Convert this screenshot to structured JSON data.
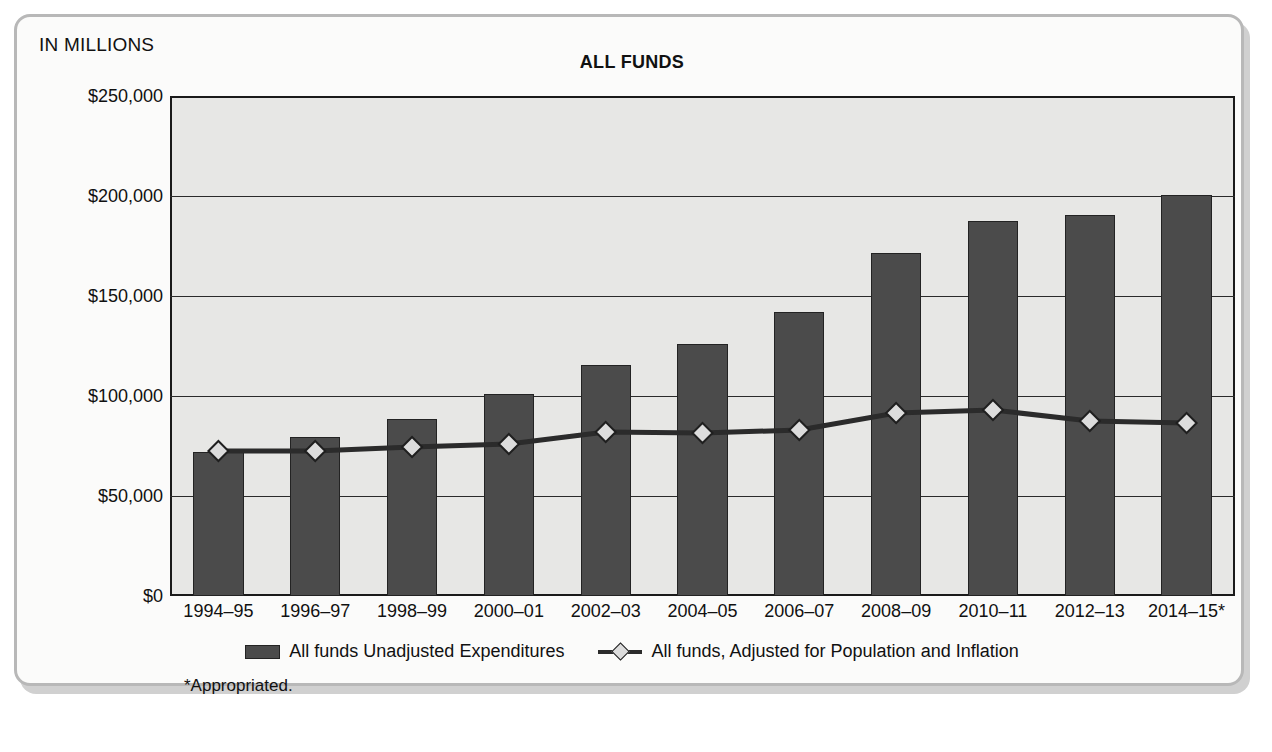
{
  "chart": {
    "units_label": "IN MILLIONS",
    "title": "ALL FUNDS",
    "footnote": "*Appropriated."
  },
  "legend": {
    "items": [
      {
        "marker": "bar-swatch",
        "label": "All funds Unadjusted Expenditures"
      },
      {
        "marker": "line-diamond-swatch",
        "label": "All funds, Adjusted for Population and Inflation"
      }
    ]
  },
  "chart_data": {
    "type": "bar",
    "title": "ALL FUNDS",
    "subtitle": "IN MILLIONS",
    "xlabel": "",
    "ylabel": "IN MILLIONS",
    "ylim": [
      0,
      250000
    ],
    "yticks": [
      0,
      50000,
      100000,
      150000,
      200000,
      250000
    ],
    "ytick_labels": [
      "$0",
      "$50,000",
      "$100,000",
      "$150,000",
      "$200,000",
      "$250,000"
    ],
    "grid": true,
    "legend_position": "bottom",
    "categories": [
      "1994–95",
      "1996–97",
      "1998–99",
      "2000–01",
      "2002–03",
      "2004–05",
      "2006–07",
      "2008–09",
      "2010–11",
      "2012–13",
      "2014–15*"
    ],
    "series": [
      {
        "name": "All funds Unadjusted Expenditures",
        "type": "bar",
        "color": "#4b4b4b",
        "values": [
          72000,
          79500,
          88500,
          101000,
          115500,
          126000,
          142000,
          171500,
          187500,
          190500,
          200500
        ]
      },
      {
        "name": "All funds, Adjusted for Population and Inflation",
        "type": "line",
        "color": "#2b2b2b",
        "marker": "diamond",
        "values": [
          72500,
          72500,
          74500,
          76000,
          82000,
          81500,
          83000,
          91500,
          93000,
          87500,
          86500
        ]
      }
    ],
    "annotations": [
      "*Appropriated."
    ]
  }
}
